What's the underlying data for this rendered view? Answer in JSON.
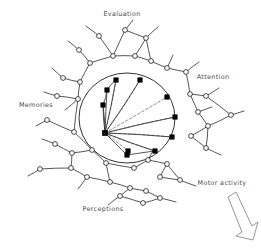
{
  "figure": {
    "background_color": "#ffffff",
    "ink_color": "#1d1d1d",
    "dashed_color": "#6e6e6e",
    "label_color": "#4a4a4a"
  },
  "labels": [
    {
      "id": "evaluation",
      "text": "Evaluation",
      "x": 122,
      "y": 16,
      "anchor": "middle"
    },
    {
      "id": "attention",
      "text": "Attention",
      "x": 213,
      "y": 79,
      "anchor": "middle"
    },
    {
      "id": "memories",
      "text": "Memories",
      "x": 36,
      "y": 107,
      "anchor": "middle"
    },
    {
      "id": "motor-activity",
      "text": "Motor activity",
      "x": 222,
      "y": 185,
      "anchor": "middle"
    },
    {
      "id": "perceptions",
      "text": "Perceptions",
      "x": 103,
      "y": 211,
      "anchor": "middle"
    }
  ],
  "core": {
    "boundary": {
      "cx": 127,
      "cy": 118,
      "rx": 48,
      "ry": 45
    },
    "hub": {
      "id": "hub",
      "x": 105,
      "y": 133
    },
    "hub_nodes": [
      {
        "id": "h1",
        "x": 107,
        "y": 90
      },
      {
        "id": "h2",
        "x": 103,
        "y": 105
      },
      {
        "id": "h3",
        "x": 116,
        "y": 80
      },
      {
        "id": "h4",
        "x": 140,
        "y": 80
      },
      {
        "id": "h5",
        "x": 167,
        "y": 97
      },
      {
        "id": "h6",
        "x": 175,
        "y": 117
      },
      {
        "id": "h7",
        "x": 172,
        "y": 137
      },
      {
        "id": "h8",
        "x": 155,
        "y": 151
      },
      {
        "id": "h9",
        "x": 127,
        "y": 155
      },
      {
        "id": "h10",
        "x": 128,
        "y": 151
      }
    ],
    "solid_spokes": [
      [
        "hub",
        "h1"
      ],
      [
        "hub",
        "h3"
      ],
      [
        "hub",
        "h4"
      ],
      [
        "hub",
        "h6"
      ],
      [
        "hub",
        "h7"
      ],
      [
        "hub",
        "h8"
      ],
      [
        "hub",
        "h9"
      ],
      [
        "hub",
        "h2"
      ]
    ],
    "dashed_spokes": [
      [
        "hub",
        "h4"
      ],
      [
        "hub",
        "h5"
      ],
      [
        "hub",
        "h6"
      ],
      [
        "hub",
        "h7"
      ],
      [
        "hub",
        "h8"
      ],
      [
        "hub",
        "h3"
      ],
      [
        "hub",
        "h10"
      ]
    ]
  },
  "periphery": {
    "node_radius": 2.4,
    "nodes": [
      {
        "id": "p1",
        "x": 99,
        "y": 36
      },
      {
        "id": "p2",
        "x": 125,
        "y": 30
      },
      {
        "id": "p3",
        "x": 146,
        "y": 38
      },
      {
        "id": "p4",
        "x": 113,
        "y": 56
      },
      {
        "id": "p5",
        "x": 135,
        "y": 56
      },
      {
        "id": "p6",
        "x": 90,
        "y": 63
      },
      {
        "id": "p7",
        "x": 151,
        "y": 61
      },
      {
        "id": "p8",
        "x": 167,
        "y": 68
      },
      {
        "id": "p9",
        "x": 79,
        "y": 50
      },
      {
        "id": "p10",
        "x": 186,
        "y": 72
      },
      {
        "id": "p11",
        "x": 63,
        "y": 78
      },
      {
        "id": "p12",
        "x": 80,
        "y": 82
      },
      {
        "id": "p13",
        "x": 57,
        "y": 96
      },
      {
        "id": "p14",
        "x": 78,
        "y": 99
      },
      {
        "id": "p15",
        "x": 190,
        "y": 94
      },
      {
        "id": "p16",
        "x": 206,
        "y": 96
      },
      {
        "id": "p17",
        "x": 198,
        "y": 112
      },
      {
        "id": "p18",
        "x": 231,
        "y": 115
      },
      {
        "id": "p19",
        "x": 208,
        "y": 126
      },
      {
        "id": "p20",
        "x": 191,
        "y": 136
      },
      {
        "id": "p21",
        "x": 206,
        "y": 148
      },
      {
        "id": "p22",
        "x": 55,
        "y": 144
      },
      {
        "id": "p23",
        "x": 72,
        "y": 153
      },
      {
        "id": "p24",
        "x": 92,
        "y": 150
      },
      {
        "id": "p25",
        "x": 106,
        "y": 163
      },
      {
        "id": "p26",
        "x": 71,
        "y": 168
      },
      {
        "id": "p27",
        "x": 134,
        "y": 168
      },
      {
        "id": "p28",
        "x": 148,
        "y": 160
      },
      {
        "id": "p29",
        "x": 167,
        "y": 164
      },
      {
        "id": "p30",
        "x": 160,
        "y": 177
      },
      {
        "id": "p31",
        "x": 180,
        "y": 180
      },
      {
        "id": "p32",
        "x": 87,
        "y": 177
      },
      {
        "id": "p33",
        "x": 110,
        "y": 182
      },
      {
        "id": "p34",
        "x": 130,
        "y": 188
      },
      {
        "id": "p35",
        "x": 120,
        "y": 196
      },
      {
        "id": "p36",
        "x": 146,
        "y": 191
      },
      {
        "id": "p37",
        "x": 160,
        "y": 198
      },
      {
        "id": "p38",
        "x": 143,
        "y": 203
      },
      {
        "id": "p39",
        "x": 47,
        "y": 120
      },
      {
        "id": "p40",
        "x": 74,
        "y": 132
      },
      {
        "id": "p41",
        "x": 40,
        "y": 169
      }
    ],
    "edges": [
      [
        "p1",
        "p4"
      ],
      [
        "p2",
        "p4"
      ],
      [
        "p2",
        "p3"
      ],
      [
        "p3",
        "p5"
      ],
      [
        "p4",
        "p5"
      ],
      [
        "p4",
        "p6"
      ],
      [
        "p5",
        "p7"
      ],
      [
        "p7",
        "p8"
      ],
      [
        "p3",
        "p7"
      ],
      [
        "p8",
        "p10"
      ],
      [
        "p9",
        "p6"
      ],
      [
        "p6",
        "p12"
      ],
      [
        "p11",
        "p12"
      ],
      [
        "p12",
        "p14"
      ],
      [
        "p13",
        "p14"
      ],
      [
        "p14",
        "p40"
      ],
      [
        "p10",
        "p15"
      ],
      [
        "p15",
        "p16"
      ],
      [
        "p15",
        "p17"
      ],
      [
        "p16",
        "p18"
      ],
      [
        "p17",
        "p19"
      ],
      [
        "p19",
        "p21"
      ],
      [
        "p19",
        "p20"
      ],
      [
        "p18",
        "p19"
      ],
      [
        "p20",
        "p21"
      ],
      [
        "p22",
        "p23"
      ],
      [
        "p23",
        "p24"
      ],
      [
        "p24",
        "p25"
      ],
      [
        "p23",
        "p26"
      ],
      [
        "p25",
        "p27"
      ],
      [
        "p27",
        "p28"
      ],
      [
        "p28",
        "p29"
      ],
      [
        "p29",
        "p30"
      ],
      [
        "p30",
        "p31"
      ],
      [
        "p29",
        "p31"
      ],
      [
        "p26",
        "p32"
      ],
      [
        "p32",
        "p33"
      ],
      [
        "p33",
        "p34"
      ],
      [
        "p34",
        "p35"
      ],
      [
        "p35",
        "p38"
      ],
      [
        "p34",
        "p36"
      ],
      [
        "p36",
        "p37"
      ],
      [
        "p37",
        "p38"
      ],
      [
        "p39",
        "p40"
      ],
      [
        "p41",
        "p26"
      ],
      [
        "p24",
        "p40"
      ],
      [
        "p25",
        "p33"
      ]
    ],
    "stubs": [
      {
        "from": "p1",
        "x": 86,
        "y": 26
      },
      {
        "from": "p2",
        "x": 133,
        "y": 20
      },
      {
        "from": "p3",
        "x": 158,
        "y": 27
      },
      {
        "from": "p9",
        "x": 68,
        "y": 41
      },
      {
        "from": "p10",
        "x": 199,
        "y": 62
      },
      {
        "from": "p11",
        "x": 52,
        "y": 68
      },
      {
        "from": "p13",
        "x": 44,
        "y": 92
      },
      {
        "from": "p16",
        "x": 219,
        "y": 88
      },
      {
        "from": "p18",
        "x": 244,
        "y": 111
      },
      {
        "from": "p21",
        "x": 221,
        "y": 155
      },
      {
        "from": "p22",
        "x": 42,
        "y": 139
      },
      {
        "from": "p31",
        "x": 196,
        "y": 186
      },
      {
        "from": "p37",
        "x": 176,
        "y": 202
      },
      {
        "from": "p39",
        "x": 36,
        "y": 126
      },
      {
        "from": "p41",
        "x": 28,
        "y": 176
      },
      {
        "from": "p32",
        "x": 78,
        "y": 189
      },
      {
        "from": "p28",
        "x": 154,
        "y": 149
      },
      {
        "from": "p14",
        "x": 65,
        "y": 110
      },
      {
        "from": "p17",
        "x": 212,
        "y": 107
      },
      {
        "from": "p35",
        "x": 108,
        "y": 205
      },
      {
        "from": "p8",
        "x": 173,
        "y": 55
      }
    ]
  },
  "arrow": {
    "id": "motor-arrow",
    "points": "228,197 236,192 252,226 258,222 253,240 236,236 242,232"
  }
}
